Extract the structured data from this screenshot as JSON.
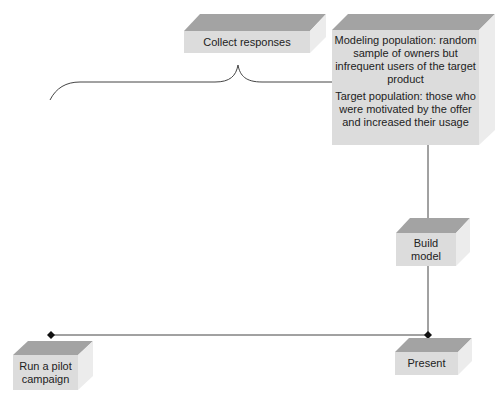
{
  "colors": {
    "top": "#a3a3a3",
    "front": "#dcdcdc",
    "side": "#ececec",
    "line": "#333333"
  },
  "boxes": {
    "collect": {
      "label": "Collect responses"
    },
    "population": {
      "modeling": "Modeling population: random sample of owners but infrequent users of the target product",
      "target": "Target population: those who were motivated by the offer and increased their usage"
    },
    "build": {
      "label": "Build model"
    },
    "pilot": {
      "label": "Run a pilot campaign"
    },
    "present": {
      "label": "Present"
    }
  }
}
